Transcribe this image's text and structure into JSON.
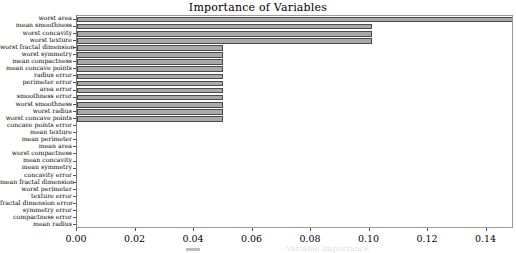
{
  "chart_data": {
    "type": "bar",
    "orientation": "horizontal",
    "title": "Importance of Variables",
    "xlabel": "",
    "ylabel": "",
    "xlim": [
      0.0,
      0.1494
    ],
    "grid": false,
    "legend": null,
    "xticks": [
      0.0,
      0.02,
      0.04,
      0.06,
      0.08,
      0.1,
      0.12,
      0.14
    ],
    "xtick_labels": [
      "0.00",
      "0.02",
      "0.04",
      "0.06",
      "0.08",
      "0.10",
      "0.12",
      "0.14"
    ],
    "categories": [
      "worst area",
      "mean smoothness",
      "worst concavity",
      "worst texture",
      "worst fractal dimension",
      "worst symmetry",
      "mean compactness",
      "mean concave points",
      "radius error",
      "perimeter error",
      "area error",
      "smoothness error",
      "worst smoothness",
      "worst radius",
      "worst concave points",
      "concave points error",
      "mean texture",
      "mean perimeter",
      "mean area",
      "worst compactness",
      "mean concavity",
      "mean symmetry",
      "concavity error",
      "mean fractal dimension",
      "worst perimeter",
      "texture error",
      "fractal dimension error",
      "symmetry error",
      "compactness error",
      "mean radius"
    ],
    "values": [
      0.1494,
      0.1009,
      0.1009,
      0.1009,
      0.0499,
      0.0499,
      0.0499,
      0.0499,
      0.0499,
      0.0499,
      0.0499,
      0.0499,
      0.0499,
      0.0499,
      0.0499,
      0.0,
      0.0,
      0.0,
      0.0,
      0.0,
      0.0,
      0.0,
      0.0,
      0.0,
      0.0,
      0.0,
      0.0,
      0.0,
      0.0,
      0.0
    ],
    "bar_facecolor": "#a9a9a9",
    "bar_edgecolor": "#4a4a4a"
  },
  "bottom_caption": {
    "text": "Variable Importance"
  }
}
